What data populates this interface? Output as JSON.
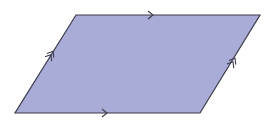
{
  "diagram": {
    "title": "Parallelogram",
    "shape": "parallelogram",
    "colors": {
      "fill": "#a9acd6",
      "stroke": "#3b3b4c",
      "background": "#ffffff"
    },
    "vertices": {
      "top_left": [
        76,
        15
      ],
      "top_right": [
        260,
        15
      ],
      "bottom_right": [
        200,
        113
      ],
      "bottom_left": [
        15,
        113
      ]
    },
    "markings": [
      {
        "side": "top",
        "type": "single-arrow",
        "position": [
          153,
          15
        ]
      },
      {
        "side": "bottom",
        "type": "single-arrow",
        "position": [
          107,
          113
        ]
      },
      {
        "side": "left",
        "type": "double-arrow",
        "position": [
          52,
          53
        ]
      },
      {
        "side": "right",
        "type": "double-arrow",
        "position": [
          234,
          60
        ]
      }
    ]
  }
}
